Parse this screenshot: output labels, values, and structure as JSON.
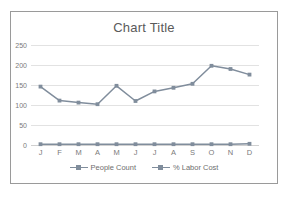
{
  "chart_data": {
    "type": "line",
    "title": "Chart Title",
    "xlabel": "",
    "ylabel": "",
    "categories": [
      "J",
      "F",
      "M",
      "A",
      "M",
      "J",
      "J",
      "A",
      "S",
      "O",
      "N",
      "D"
    ],
    "yticks": [
      0,
      50,
      100,
      150,
      200,
      250
    ],
    "ylim": [
      0,
      250
    ],
    "grid": true,
    "legend_position": "bottom",
    "series": [
      {
        "name": "People Count",
        "color": "#808d9c",
        "values": [
          146,
          111,
          106,
          102,
          148,
          110,
          134,
          143,
          153,
          198,
          190,
          176
        ]
      },
      {
        "name": "% Labor Cost",
        "color": "#808d9c",
        "values": [
          2,
          2,
          2,
          2,
          2,
          2,
          2,
          2,
          2,
          2,
          2,
          3
        ]
      }
    ]
  },
  "legend": {
    "items": [
      {
        "label": "People Count"
      },
      {
        "label": "% Labor Cost"
      }
    ]
  }
}
